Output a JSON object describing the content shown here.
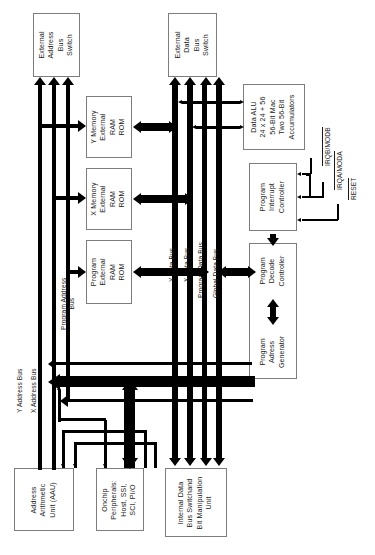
{
  "diagram": {
    "orientation": "rotated-90-ccw",
    "blocks": [
      {
        "id": "ext-addr-switch",
        "lines": [
          "External",
          "Address",
          "Bus",
          "Switch"
        ]
      },
      {
        "id": "ext-data-switch",
        "lines": [
          "External",
          "Data",
          "Bus",
          "Switch"
        ]
      },
      {
        "id": "y-memory",
        "lines": [
          "Y Memory",
          "External",
          "RAM",
          "ROM"
        ]
      },
      {
        "id": "x-memory",
        "lines": [
          "X Memory",
          "External",
          "RAM",
          "ROM"
        ]
      },
      {
        "id": "program-memory",
        "lines": [
          "Program",
          "External",
          "RAM",
          "ROM"
        ]
      },
      {
        "id": "data-alu",
        "lines": [
          "Data ALU",
          "24 x 24 + 56",
          "56-Bit Mac",
          "Two 56-Bit",
          "Accumulators"
        ]
      },
      {
        "id": "program-interrupt-controller",
        "lines": [
          "Program",
          "Interrupt",
          "Controller"
        ]
      },
      {
        "id": "program-decode-controller",
        "lines": [
          "Program",
          "Decode",
          "Controller"
        ]
      },
      {
        "id": "program-address-generator",
        "lines": [
          "Program",
          "Adress",
          "Generator"
        ]
      },
      {
        "id": "address-arithmetic-unit",
        "lines": [
          "Address",
          "Arithmetic",
          "Unit (AAU)"
        ]
      },
      {
        "id": "onchip-peripherals",
        "lines": [
          "Onchip",
          "Peripherals:",
          "Host, SSI,",
          "SCI, PI/O"
        ]
      },
      {
        "id": "internal-data-bus-switch",
        "lines": [
          "Internal Data",
          "Bus Switchand",
          "Bit Manipulation",
          "Unit"
        ]
      }
    ],
    "bus_labels": [
      {
        "id": "y-address-bus",
        "text": "Y Address Bus"
      },
      {
        "id": "x-address-bus",
        "text": "X Address Bus"
      },
      {
        "id": "program-address-bus",
        "lines": [
          "Program Address",
          "Bus"
        ]
      },
      {
        "id": "y-data-bus",
        "text": "Y Data Bus"
      },
      {
        "id": "x-data-bus",
        "text": "X Data Bus"
      },
      {
        "id": "program-data-bus",
        "text": "Program Data Bus"
      },
      {
        "id": "global-data-bus",
        "text": "Global Data Bus"
      }
    ],
    "signals": [
      {
        "id": "irqb-modb",
        "text": "IRQB/MODB",
        "active_low": true
      },
      {
        "id": "irqa-moda",
        "text": "IRQA/MODA",
        "active_low": true
      },
      {
        "id": "reset",
        "text": "RESET",
        "active_low": true
      }
    ],
    "colors": {
      "line": "#000000",
      "box_border": "#7d7d7d",
      "background": "#ffffff",
      "text": "#1a1a1a"
    }
  }
}
